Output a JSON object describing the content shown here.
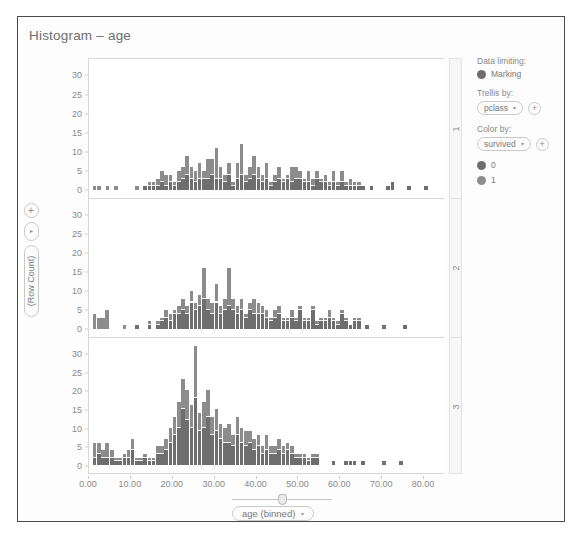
{
  "chart_title": "Histogram – age",
  "axis_controls": {
    "add_label": "+",
    "menu_label": "▸",
    "y_measure_label": "(Row Count)",
    "x_measure_label": "age (binned)",
    "x_caret": "▾"
  },
  "legend": {
    "data_limiting_label": "Data limiting:",
    "marking_label": "Marking",
    "marking_color": "#6e6e6e",
    "trellis_by_label": "Trellis by:",
    "trellis_by_value": "pclass",
    "color_by_label": "Color by:",
    "color_by_value": "survived",
    "caret": "▾",
    "add_label": "+",
    "items": [
      {
        "label": "0",
        "color": "#6e6e6e"
      },
      {
        "label": "1",
        "color": "#8c8c8c"
      }
    ]
  },
  "chart_data": {
    "type": "bar",
    "subtype": "stacked-histogram-trellis",
    "title": "Histogram – age",
    "xlabel": "age (binned)",
    "ylabel": "(Row Count)",
    "xlim": [
      0,
      85
    ],
    "ylim": [
      0,
      33
    ],
    "xticks": [
      "0.00",
      "10.00",
      "20.00",
      "30.00",
      "40.00",
      "50.00",
      "60.00",
      "70.00",
      "80.00"
    ],
    "xtick_values": [
      0,
      10,
      20,
      30,
      40,
      50,
      60,
      70,
      80
    ],
    "yticks": [
      "0",
      "5",
      "10",
      "15",
      "20",
      "25",
      "30"
    ],
    "ytick_values": [
      0,
      5,
      10,
      15,
      20,
      25,
      30
    ],
    "grid": false,
    "legend_position": "right",
    "legend_entries": [
      "0",
      "1"
    ],
    "series_colors": {
      "0": "#6e6e6e",
      "1": "#8c8c8c"
    },
    "trellis_by": "pclass",
    "color_by": "survived",
    "bin_width": 1,
    "panels": [
      {
        "label": "1",
        "bins": [
          {
            "x": 0.9,
            "s0": 0,
            "s1": 1
          },
          {
            "x": 2.0,
            "s0": 0,
            "s1": 1
          },
          {
            "x": 4.0,
            "s0": 0,
            "s1": 1
          },
          {
            "x": 6.0,
            "s0": 0,
            "s1": 1
          },
          {
            "x": 11.0,
            "s0": 0,
            "s1": 1
          },
          {
            "x": 13.0,
            "s0": 1,
            "s1": 0
          },
          {
            "x": 14.0,
            "s0": 1,
            "s1": 1
          },
          {
            "x": 15.0,
            "s0": 1,
            "s1": 1
          },
          {
            "x": 16.0,
            "s0": 1,
            "s1": 2
          },
          {
            "x": 17.0,
            "s0": 2,
            "s1": 3
          },
          {
            "x": 18.0,
            "s0": 1,
            "s1": 3
          },
          {
            "x": 19.0,
            "s0": 2,
            "s1": 2
          },
          {
            "x": 20.0,
            "s0": 1,
            "s1": 1
          },
          {
            "x": 21.0,
            "s0": 2,
            "s1": 3
          },
          {
            "x": 22.0,
            "s0": 3,
            "s1": 3
          },
          {
            "x": 23.0,
            "s0": 4,
            "s1": 5
          },
          {
            "x": 24.0,
            "s0": 3,
            "s1": 3
          },
          {
            "x": 25.0,
            "s0": 2,
            "s1": 3
          },
          {
            "x": 26.0,
            "s0": 3,
            "s1": 4
          },
          {
            "x": 27.0,
            "s0": 3,
            "s1": 2
          },
          {
            "x": 28.0,
            "s0": 3,
            "s1": 5
          },
          {
            "x": 29.0,
            "s0": 4,
            "s1": 4
          },
          {
            "x": 30.0,
            "s0": 3,
            "s1": 8
          },
          {
            "x": 31.0,
            "s0": 3,
            "s1": 3
          },
          {
            "x": 32.0,
            "s0": 2,
            "s1": 2
          },
          {
            "x": 33.0,
            "s0": 4,
            "s1": 3
          },
          {
            "x": 34.0,
            "s0": 1,
            "s1": 1
          },
          {
            "x": 35.0,
            "s0": 3,
            "s1": 4
          },
          {
            "x": 36.0,
            "s0": 4,
            "s1": 8
          },
          {
            "x": 37.0,
            "s0": 2,
            "s1": 2
          },
          {
            "x": 38.0,
            "s0": 3,
            "s1": 3
          },
          {
            "x": 39.0,
            "s0": 4,
            "s1": 5
          },
          {
            "x": 40.0,
            "s0": 3,
            "s1": 3
          },
          {
            "x": 41.0,
            "s0": 2,
            "s1": 2
          },
          {
            "x": 42.0,
            "s0": 3,
            "s1": 4
          },
          {
            "x": 43.0,
            "s0": 1,
            "s1": 1
          },
          {
            "x": 44.0,
            "s0": 2,
            "s1": 2
          },
          {
            "x": 45.0,
            "s0": 3,
            "s1": 3
          },
          {
            "x": 46.0,
            "s0": 2,
            "s1": 1
          },
          {
            "x": 47.0,
            "s0": 3,
            "s1": 1
          },
          {
            "x": 48.0,
            "s0": 2,
            "s1": 4
          },
          {
            "x": 49.0,
            "s0": 3,
            "s1": 3
          },
          {
            "x": 50.0,
            "s0": 3,
            "s1": 2
          },
          {
            "x": 51.0,
            "s0": 2,
            "s1": 1
          },
          {
            "x": 52.0,
            "s0": 2,
            "s1": 3
          },
          {
            "x": 53.0,
            "s0": 1,
            "s1": 2
          },
          {
            "x": 54.0,
            "s0": 3,
            "s1": 2
          },
          {
            "x": 55.0,
            "s0": 2,
            "s1": 1
          },
          {
            "x": 56.0,
            "s0": 2,
            "s1": 2
          },
          {
            "x": 57.0,
            "s0": 1,
            "s1": 1
          },
          {
            "x": 58.0,
            "s0": 2,
            "s1": 3
          },
          {
            "x": 59.0,
            "s0": 1,
            "s1": 1
          },
          {
            "x": 60.0,
            "s0": 2,
            "s1": 3
          },
          {
            "x": 61.0,
            "s0": 1,
            "s1": 1
          },
          {
            "x": 62.0,
            "s0": 1,
            "s1": 2
          },
          {
            "x": 63.0,
            "s0": 1,
            "s1": 1
          },
          {
            "x": 64.0,
            "s0": 1,
            "s1": 1
          },
          {
            "x": 65.0,
            "s0": 1,
            "s1": 0
          },
          {
            "x": 67.0,
            "s0": 1,
            "s1": 0
          },
          {
            "x": 71.0,
            "s0": 1,
            "s1": 0
          },
          {
            "x": 72.0,
            "s0": 2,
            "s1": 0
          },
          {
            "x": 76.0,
            "s0": 1,
            "s1": 0
          },
          {
            "x": 80.0,
            "s0": 1,
            "s1": 0
          }
        ]
      },
      {
        "label": "2",
        "bins": [
          {
            "x": 0.9,
            "s0": 0,
            "s1": 4
          },
          {
            "x": 1.9,
            "s0": 0,
            "s1": 3
          },
          {
            "x": 2.9,
            "s0": 0,
            "s1": 3
          },
          {
            "x": 3.9,
            "s0": 0,
            "s1": 5
          },
          {
            "x": 8.0,
            "s0": 0,
            "s1": 1
          },
          {
            "x": 11.0,
            "s0": 1,
            "s1": 0
          },
          {
            "x": 14.0,
            "s0": 1,
            "s1": 1
          },
          {
            "x": 16.0,
            "s0": 1,
            "s1": 1
          },
          {
            "x": 17.0,
            "s0": 2,
            "s1": 1
          },
          {
            "x": 18.0,
            "s0": 3,
            "s1": 2
          },
          {
            "x": 19.0,
            "s0": 2,
            "s1": 2
          },
          {
            "x": 20.0,
            "s0": 4,
            "s1": 1
          },
          {
            "x": 21.0,
            "s0": 4,
            "s1": 2
          },
          {
            "x": 22.0,
            "s0": 5,
            "s1": 3
          },
          {
            "x": 23.0,
            "s0": 4,
            "s1": 2
          },
          {
            "x": 24.0,
            "s0": 7,
            "s1": 3
          },
          {
            "x": 25.0,
            "s0": 5,
            "s1": 2
          },
          {
            "x": 26.0,
            "s0": 6,
            "s1": 3
          },
          {
            "x": 27.0,
            "s0": 8,
            "s1": 8
          },
          {
            "x": 28.0,
            "s0": 5,
            "s1": 3
          },
          {
            "x": 29.0,
            "s0": 4,
            "s1": 3
          },
          {
            "x": 30.0,
            "s0": 7,
            "s1": 5
          },
          {
            "x": 31.0,
            "s0": 4,
            "s1": 2
          },
          {
            "x": 32.0,
            "s0": 5,
            "s1": 3
          },
          {
            "x": 33.0,
            "s0": 6,
            "s1": 10
          },
          {
            "x": 34.0,
            "s0": 5,
            "s1": 3
          },
          {
            "x": 35.0,
            "s0": 4,
            "s1": 2
          },
          {
            "x": 36.0,
            "s0": 5,
            "s1": 3
          },
          {
            "x": 37.0,
            "s0": 3,
            "s1": 1
          },
          {
            "x": 38.0,
            "s0": 5,
            "s1": 2
          },
          {
            "x": 39.0,
            "s0": 4,
            "s1": 4
          },
          {
            "x": 40.0,
            "s0": 4,
            "s1": 3
          },
          {
            "x": 41.0,
            "s0": 4,
            "s1": 2
          },
          {
            "x": 42.0,
            "s0": 3,
            "s1": 2
          },
          {
            "x": 43.0,
            "s0": 2,
            "s1": 1
          },
          {
            "x": 44.0,
            "s0": 3,
            "s1": 2
          },
          {
            "x": 45.0,
            "s0": 4,
            "s1": 2
          },
          {
            "x": 46.0,
            "s0": 2,
            "s1": 1
          },
          {
            "x": 47.0,
            "s0": 2,
            "s1": 1
          },
          {
            "x": 48.0,
            "s0": 3,
            "s1": 2
          },
          {
            "x": 49.0,
            "s0": 2,
            "s1": 1
          },
          {
            "x": 50.0,
            "s0": 5,
            "s1": 1
          },
          {
            "x": 51.0,
            "s0": 2,
            "s1": 1
          },
          {
            "x": 52.0,
            "s0": 2,
            "s1": 1
          },
          {
            "x": 53.0,
            "s0": 5,
            "s1": 1
          },
          {
            "x": 54.0,
            "s0": 1,
            "s1": 1
          },
          {
            "x": 55.0,
            "s0": 2,
            "s1": 1
          },
          {
            "x": 56.0,
            "s0": 2,
            "s1": 1
          },
          {
            "x": 57.0,
            "s0": 3,
            "s1": 2
          },
          {
            "x": 58.0,
            "s0": 2,
            "s1": 1
          },
          {
            "x": 59.0,
            "s0": 1,
            "s1": 1
          },
          {
            "x": 60.0,
            "s0": 4,
            "s1": 1
          },
          {
            "x": 61.0,
            "s0": 2,
            "s1": 1
          },
          {
            "x": 62.0,
            "s0": 1,
            "s1": 0
          },
          {
            "x": 63.0,
            "s0": 2,
            "s1": 1
          },
          {
            "x": 64.0,
            "s0": 2,
            "s1": 1
          },
          {
            "x": 66.0,
            "s0": 1,
            "s1": 0
          },
          {
            "x": 70.0,
            "s0": 1,
            "s1": 0
          },
          {
            "x": 75.0,
            "s0": 1,
            "s1": 0
          }
        ]
      },
      {
        "label": "3",
        "bins": [
          {
            "x": 0.9,
            "s0": 2,
            "s1": 4
          },
          {
            "x": 1.9,
            "s0": 3,
            "s1": 3
          },
          {
            "x": 2.9,
            "s0": 2,
            "s1": 2
          },
          {
            "x": 3.9,
            "s0": 2,
            "s1": 4
          },
          {
            "x": 5.0,
            "s0": 2,
            "s1": 2
          },
          {
            "x": 6.0,
            "s0": 1,
            "s1": 1
          },
          {
            "x": 7.0,
            "s0": 1,
            "s1": 1
          },
          {
            "x": 8.0,
            "s0": 2,
            "s1": 1
          },
          {
            "x": 9.0,
            "s0": 2,
            "s1": 2
          },
          {
            "x": 10.0,
            "s0": 4,
            "s1": 3
          },
          {
            "x": 11.0,
            "s0": 1,
            "s1": 1
          },
          {
            "x": 12.0,
            "s0": 1,
            "s1": 1
          },
          {
            "x": 13.0,
            "s0": 2,
            "s1": 1
          },
          {
            "x": 14.0,
            "s0": 1,
            "s1": 1
          },
          {
            "x": 15.0,
            "s0": 1,
            "s1": 1
          },
          {
            "x": 16.0,
            "s0": 3,
            "s1": 2
          },
          {
            "x": 17.0,
            "s0": 3,
            "s1": 2
          },
          {
            "x": 18.0,
            "s0": 4,
            "s1": 3
          },
          {
            "x": 19.0,
            "s0": 6,
            "s1": 4
          },
          {
            "x": 20.0,
            "s0": 8,
            "s1": 5
          },
          {
            "x": 21.0,
            "s0": 10,
            "s1": 7
          },
          {
            "x": 22.0,
            "s0": 15,
            "s1": 8
          },
          {
            "x": 23.0,
            "s0": 12,
            "s1": 8
          },
          {
            "x": 24.0,
            "s0": 10,
            "s1": 6
          },
          {
            "x": 25.0,
            "s0": 18,
            "s1": 14
          },
          {
            "x": 26.0,
            "s0": 9,
            "s1": 5
          },
          {
            "x": 27.0,
            "s0": 10,
            "s1": 7
          },
          {
            "x": 28.0,
            "s0": 13,
            "s1": 7
          },
          {
            "x": 29.0,
            "s0": 8,
            "s1": 5
          },
          {
            "x": 30.0,
            "s0": 9,
            "s1": 6
          },
          {
            "x": 31.0,
            "s0": 7,
            "s1": 4
          },
          {
            "x": 32.0,
            "s0": 6,
            "s1": 4
          },
          {
            "x": 33.0,
            "s0": 6,
            "s1": 5
          },
          {
            "x": 34.0,
            "s0": 5,
            "s1": 3
          },
          {
            "x": 35.0,
            "s0": 8,
            "s1": 5
          },
          {
            "x": 36.0,
            "s0": 6,
            "s1": 4
          },
          {
            "x": 37.0,
            "s0": 5,
            "s1": 4
          },
          {
            "x": 38.0,
            "s0": 6,
            "s1": 3
          },
          {
            "x": 39.0,
            "s0": 4,
            "s1": 3
          },
          {
            "x": 40.0,
            "s0": 5,
            "s1": 3
          },
          {
            "x": 41.0,
            "s0": 3,
            "s1": 2
          },
          {
            "x": 42.0,
            "s0": 4,
            "s1": 4
          },
          {
            "x": 43.0,
            "s0": 3,
            "s1": 2
          },
          {
            "x": 44.0,
            "s0": 3,
            "s1": 2
          },
          {
            "x": 45.0,
            "s0": 4,
            "s1": 3
          },
          {
            "x": 46.0,
            "s0": 3,
            "s1": 2
          },
          {
            "x": 47.0,
            "s0": 4,
            "s1": 2
          },
          {
            "x": 48.0,
            "s0": 3,
            "s1": 2
          },
          {
            "x": 49.0,
            "s0": 2,
            "s1": 1
          },
          {
            "x": 50.0,
            "s0": 2,
            "s1": 1
          },
          {
            "x": 51.0,
            "s0": 2,
            "s1": 1
          },
          {
            "x": 52.0,
            "s0": 1,
            "s1": 1
          },
          {
            "x": 53.0,
            "s0": 2,
            "s1": 1
          },
          {
            "x": 54.0,
            "s0": 2,
            "s1": 1
          },
          {
            "x": 58.0,
            "s0": 1,
            "s1": 0
          },
          {
            "x": 61.0,
            "s0": 1,
            "s1": 0
          },
          {
            "x": 62.0,
            "s0": 1,
            "s1": 0
          },
          {
            "x": 63.0,
            "s0": 1,
            "s1": 0
          },
          {
            "x": 65.0,
            "s0": 1,
            "s1": 0
          },
          {
            "x": 70.0,
            "s0": 1,
            "s1": 0
          },
          {
            "x": 74.0,
            "s0": 1,
            "s1": 0
          }
        ]
      }
    ]
  }
}
